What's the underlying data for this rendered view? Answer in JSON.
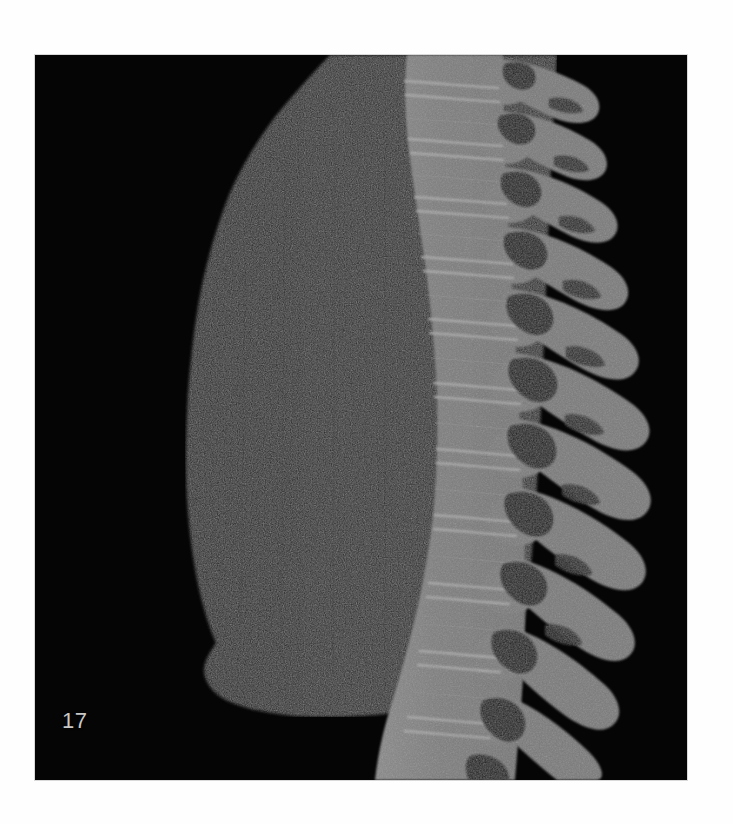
{
  "viewer": {
    "modality": "CT",
    "plane": "sagittal",
    "slice_label": "17",
    "background_color": "#000000",
    "page_background_color": "#ffffff",
    "label_color": "#c8c8c8",
    "frame": {
      "x": 35,
      "y": 55,
      "width": 652,
      "height": 725
    }
  },
  "palette": {
    "air_black": "#000000",
    "lung_parenchyma": "#232323",
    "lung_parenchyma_light": "#2c2c2c",
    "trabecular_bone": "#7c7c7c",
    "cortical_bone": "#a2a2a2",
    "bone_bright_endplate": "#b4b4b4",
    "bone_mid": "#888888",
    "foramen_dark": "#1a1a1a",
    "disc_space": "#5a5a5a"
  },
  "anatomy": {
    "structures": [
      {
        "name": "lung",
        "label": "Lung parenchyma (left lung, sagittal)",
        "density": "low",
        "color": "#232323"
      },
      {
        "name": "vertebral-column",
        "label": "Thoracolumbar vertebral column",
        "density": "high",
        "color": "#7c7c7c"
      },
      {
        "name": "spinous-processes",
        "label": "Spinous processes",
        "density": "high",
        "color": "#7c7c7c"
      },
      {
        "name": "intervertebral-discs",
        "label": "Intervertebral disc spaces",
        "density": "medium",
        "color": "#5a5a5a"
      },
      {
        "name": "neural-foramina",
        "label": "Neural foramina / spinal canal",
        "density": "low",
        "color": "#1a1a1a"
      },
      {
        "name": "diaphragm-margin",
        "label": "Inferior lung margin / diaphragm",
        "density": "low",
        "color": "#000000"
      }
    ],
    "vertebra_count": 14
  },
  "geometry": {
    "lung_outline": "M 295 2 L 268 28 L 248 52 L 231 76 L 214 104 L 200 132 L 188 160 L 178 190 L 170 222 L 163 256 L 157 292 L 153 330 L 150 368 L 149 404 L 150 440 L 153 474 L 157 504 L 162 532 L 168 556 L 176 578 L 172 592 L 166 604 L 167 618 L 174 630 L 186 640 L 204 648 L 228 654 L 258 657 L 292 658 L 330 656 L 368 651 L 404 644 L 436 634 L 462 622 L 478 606 L 486 580 L 492 540 L 497 490 L 501 436 L 504 382 L 506 330 L 508 278 L 510 228 L 512 180 L 514 134 L 516 92 L 518 52 L 520 18 L 521 0 Z",
    "spine_anterior_top_x": 372,
    "spine_anterior_bottom_x": 352,
    "spine_posterior_top_x": 470,
    "spine_posterior_bottom_x": 470,
    "vertebra_levels": [
      {
        "index": 1,
        "cy": 10,
        "ax": 372,
        "h": 42,
        "w": 96,
        "sp_len": 88,
        "sp_angle": 26
      },
      {
        "index": 2,
        "cy": 62,
        "ax": 376,
        "h": 44,
        "w": 98,
        "sp_len": 92,
        "sp_angle": 26
      },
      {
        "index": 3,
        "cy": 116,
        "ax": 382,
        "h": 46,
        "w": 100,
        "sp_len": 96,
        "sp_angle": 27
      },
      {
        "index": 4,
        "cy": 172,
        "ax": 388,
        "h": 48,
        "w": 102,
        "sp_len": 100,
        "sp_angle": 28
      },
      {
        "index": 5,
        "cy": 230,
        "ax": 394,
        "h": 50,
        "w": 104,
        "sp_len": 104,
        "sp_angle": 29
      },
      {
        "index": 6,
        "cy": 290,
        "ax": 398,
        "h": 52,
        "w": 106,
        "sp_len": 108,
        "sp_angle": 30
      },
      {
        "index": 7,
        "cy": 352,
        "ax": 400,
        "h": 54,
        "w": 108,
        "sp_len": 110,
        "sp_angle": 31
      },
      {
        "index": 8,
        "cy": 414,
        "ax": 399,
        "h": 56,
        "w": 110,
        "sp_len": 112,
        "sp_angle": 32
      },
      {
        "index": 9,
        "cy": 478,
        "ax": 395,
        "h": 58,
        "w": 112,
        "sp_len": 114,
        "sp_angle": 33
      },
      {
        "index": 10,
        "cy": 542,
        "ax": 388,
        "h": 60,
        "w": 116,
        "sp_len": 114,
        "sp_angle": 34
      },
      {
        "index": 11,
        "cy": 606,
        "ax": 378,
        "h": 62,
        "w": 120,
        "sp_len": 112,
        "sp_angle": 34
      },
      {
        "index": 12,
        "cy": 668,
        "ax": 368,
        "h": 64,
        "w": 126,
        "sp_len": 108,
        "sp_angle": 33
      },
      {
        "index": 13,
        "cy": 710,
        "ax": 358,
        "h": 60,
        "w": 132,
        "sp_len": 100,
        "sp_angle": 30
      }
    ]
  }
}
